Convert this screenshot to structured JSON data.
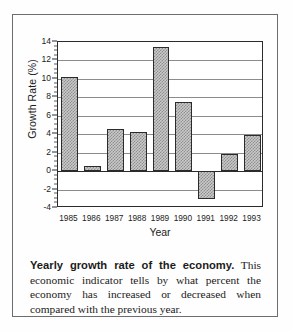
{
  "figure": {
    "caption_lead": "Yearly growth rate of the economy.",
    "caption_body": " This economic indicator tells by what percent the economy has increased or decreased when compared with the previous year."
  },
  "chart_data": {
    "type": "bar",
    "title": "",
    "xlabel": "Year",
    "ylabel": "Growth Rate (%)",
    "categories": [
      "1985",
      "1986",
      "1987",
      "1988",
      "1989",
      "1990",
      "1991",
      "1992",
      "1993"
    ],
    "values": [
      10.2,
      0.6,
      4.6,
      4.2,
      13.5,
      7.5,
      -3.0,
      1.9,
      3.9
    ],
    "ylim": [
      -4,
      14
    ],
    "ytick_labels": [
      "14",
      "12",
      "10",
      "8",
      "6",
      "4",
      "2",
      "0",
      "-2",
      "-4"
    ],
    "ytick_values": [
      14,
      12,
      10,
      8,
      6,
      4,
      2,
      0,
      -2,
      -4
    ],
    "ytick_step": 2,
    "grid": true,
    "legend": "none",
    "bar_fill": "#c9c9c9",
    "bar_edge": "#2b2b2b"
  }
}
